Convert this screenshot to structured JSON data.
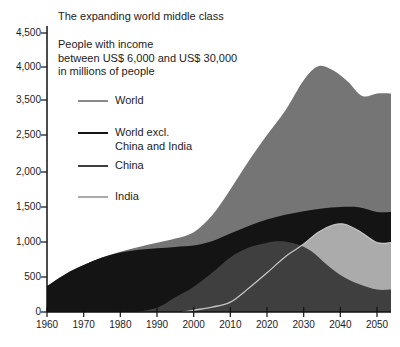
{
  "title": "The expanding world middle class",
  "subtitle_lines": [
    "People with income",
    "between US$ 6,000 and US$ 30,000",
    "in millions of people"
  ],
  "colors": {
    "background": "#ffffff",
    "text": "#1c1c1c",
    "axis": "#111111",
    "world_fill": "#757575",
    "world_excl_fill": "#141414",
    "china_fill": "#3f3f3f",
    "india_fill": "#ababab",
    "india_outline": "#c4c4c4"
  },
  "chart_data": {
    "type": "area",
    "title": "The expanding world middle class",
    "xlabel": "",
    "ylabel": "People with income between US$ 6,000 and US$ 30,000 in millions of people",
    "x_ticks": [
      "1960",
      "1970",
      "1980",
      "1990",
      "2000",
      "2010",
      "2020",
      "2030",
      "2040",
      "2050"
    ],
    "y_ticks": [
      "0",
      "500",
      "1,000",
      "1,500",
      "2,000",
      "2,500",
      "3,500",
      "4,000",
      "4,500"
    ],
    "y_axis_note": "printed axis labels are evenly spaced but omit 3,000",
    "xlim": [
      1960,
      2050
    ],
    "grid": false,
    "legend_position": "upper-left",
    "series": [
      {
        "name": "World",
        "color": "#757575",
        "points": [
          [
            1960,
            370
          ],
          [
            1965,
            540
          ],
          [
            1970,
            670
          ],
          [
            1975,
            780
          ],
          [
            1980,
            860
          ],
          [
            1985,
            930
          ],
          [
            1990,
            990
          ],
          [
            1995,
            1050
          ],
          [
            2000,
            1140
          ],
          [
            2005,
            1380
          ],
          [
            2010,
            1750
          ],
          [
            2015,
            2150
          ],
          [
            2020,
            2500
          ],
          [
            2025,
            3200
          ],
          [
            2030,
            3800
          ],
          [
            2034,
            4010
          ],
          [
            2038,
            3950
          ],
          [
            2042,
            3780
          ],
          [
            2046,
            3560
          ],
          [
            2050,
            3600
          ]
        ]
      },
      {
        "name": "World excl. China and India",
        "color": "#141414",
        "points": [
          [
            1960,
            370
          ],
          [
            1965,
            540
          ],
          [
            1970,
            670
          ],
          [
            1975,
            780
          ],
          [
            1980,
            850
          ],
          [
            1985,
            890
          ],
          [
            1990,
            910
          ],
          [
            1995,
            930
          ],
          [
            2000,
            950
          ],
          [
            2005,
            1010
          ],
          [
            2010,
            1120
          ],
          [
            2015,
            1230
          ],
          [
            2020,
            1320
          ],
          [
            2025,
            1390
          ],
          [
            2030,
            1440
          ],
          [
            2035,
            1480
          ],
          [
            2040,
            1500
          ],
          [
            2045,
            1495
          ],
          [
            2050,
            1430
          ]
        ]
      },
      {
        "name": "India",
        "color": "#ababab",
        "outline": "#c4c4c4",
        "points": [
          [
            1997,
            0
          ],
          [
            2000,
            25
          ],
          [
            2005,
            70
          ],
          [
            2010,
            140
          ],
          [
            2015,
            340
          ],
          [
            2020,
            560
          ],
          [
            2025,
            790
          ],
          [
            2030,
            970
          ],
          [
            2034,
            1140
          ],
          [
            2038,
            1240
          ],
          [
            2041,
            1255
          ],
          [
            2045,
            1160
          ],
          [
            2050,
            990
          ]
        ]
      },
      {
        "name": "China",
        "color": "#3f3f3f",
        "points": [
          [
            1984,
            0
          ],
          [
            1990,
            60
          ],
          [
            1995,
            210
          ],
          [
            2000,
            360
          ],
          [
            2005,
            560
          ],
          [
            2010,
            780
          ],
          [
            2015,
            920
          ],
          [
            2020,
            990
          ],
          [
            2024,
            1010
          ],
          [
            2028,
            970
          ],
          [
            2032,
            870
          ],
          [
            2036,
            690
          ],
          [
            2040,
            530
          ],
          [
            2045,
            400
          ],
          [
            2050,
            320
          ]
        ]
      }
    ],
    "legend": [
      {
        "lines": [
          "World"
        ],
        "color": "#8a8a8a",
        "thickness": 1.5
      },
      {
        "lines": [
          "World excl.",
          "China and India"
        ],
        "color": "#141414",
        "thickness": 2.5
      },
      {
        "lines": [
          "China"
        ],
        "color": "#3f3f3f",
        "thickness": 2
      },
      {
        "lines": [
          "India"
        ],
        "color": "#ababab",
        "thickness": 1.5
      }
    ]
  }
}
